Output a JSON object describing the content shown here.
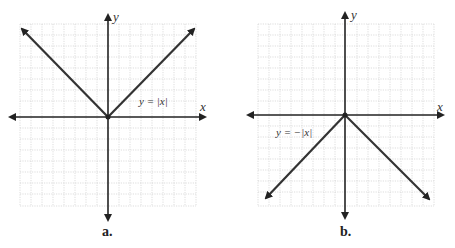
{
  "panels": [
    {
      "id": "a",
      "label": "a.",
      "equation": "y = |x|",
      "x_axis_label": "x",
      "y_axis_label": "y"
    },
    {
      "id": "b",
      "label": "b.",
      "equation": "y = −|x|",
      "x_axis_label": "x",
      "y_axis_label": "y"
    }
  ],
  "colors": {
    "grid": "#c8c8c8",
    "axis": "#222222",
    "graph": "#333333",
    "text": "#333333"
  }
}
